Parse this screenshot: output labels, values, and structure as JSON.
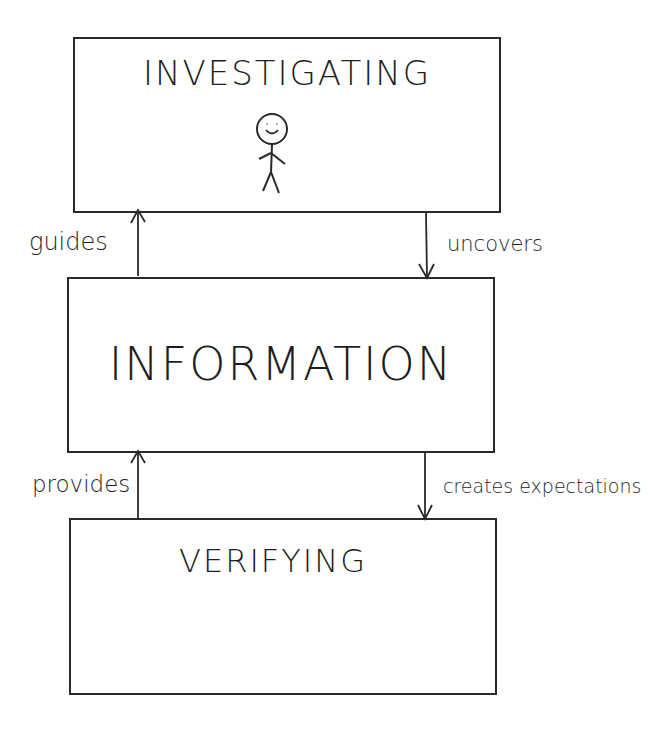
{
  "diagram": {
    "boxes": [
      {
        "id": "investigating",
        "title": "INVESTIGATING",
        "icon": "stick-figure-icon"
      },
      {
        "id": "information",
        "title": "INFORMATION"
      },
      {
        "id": "verifying",
        "title": "VERIFYING"
      }
    ],
    "arrows": [
      {
        "from": "information",
        "to": "investigating",
        "label": "guides",
        "side": "left"
      },
      {
        "from": "investigating",
        "to": "information",
        "label": "uncovers",
        "side": "right"
      },
      {
        "from": "verifying",
        "to": "information",
        "label": "provides",
        "side": "left"
      },
      {
        "from": "information",
        "to": "verifying",
        "label": "creates expectations",
        "side": "right"
      }
    ],
    "colors": {
      "stroke": "#2a2a2a",
      "background": "#ffffff"
    }
  }
}
